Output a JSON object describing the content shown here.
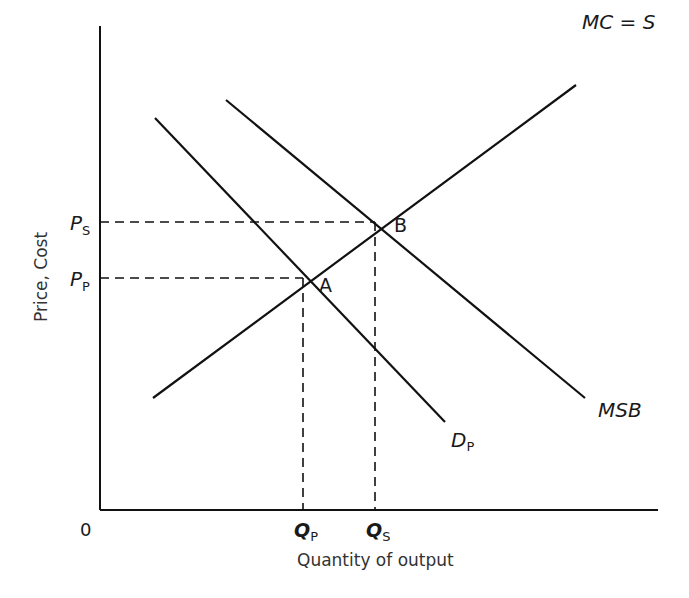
{
  "diagram": {
    "type": "supply-demand-externality",
    "axes": {
      "x_label": "Quantity of output",
      "y_label": "Price, Cost",
      "origin_label": "0"
    },
    "curves": {
      "mc_s": {
        "label": "MC = S",
        "main": "MC = S"
      },
      "msb": {
        "label": "MSB"
      },
      "dp": {
        "label_main": "D",
        "label_sub": "P"
      }
    },
    "points": {
      "a": {
        "label": "A"
      },
      "b": {
        "label": "B"
      }
    },
    "price_ticks": {
      "ps": {
        "main": "P",
        "sub": "S"
      },
      "pp": {
        "main": "P",
        "sub": "P"
      }
    },
    "quantity_ticks": {
      "qp": {
        "main": "Q",
        "sub": "P"
      },
      "qs": {
        "main": "Q",
        "sub": "S"
      }
    }
  },
  "colors": {
    "line": "#111111",
    "text": "#1a1a1a",
    "background": "#ffffff"
  }
}
